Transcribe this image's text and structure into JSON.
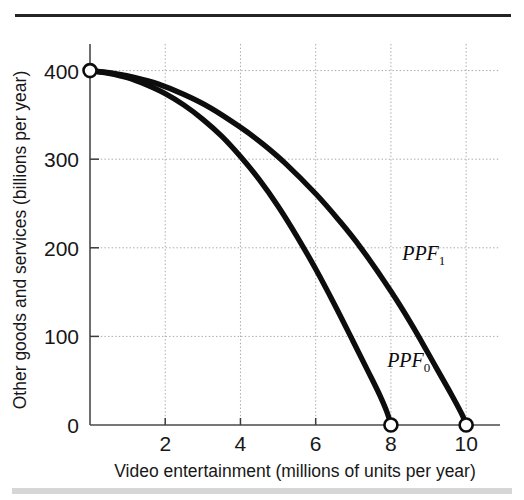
{
  "chart_data": {
    "type": "line",
    "title": "",
    "xlabel": "Video entertainment (millions of units per year)",
    "ylabel": "Other goods and services (billions per year)",
    "xlim": [
      0,
      10.9
    ],
    "ylim": [
      0,
      430
    ],
    "xticks": [
      2,
      4,
      6,
      8,
      10
    ],
    "xtick_labels": [
      "2",
      "4",
      "6",
      "8",
      "10"
    ],
    "yticks": [
      0,
      100,
      200,
      300,
      400
    ],
    "ytick_labels": [
      "0",
      "100",
      "200",
      "300",
      "400"
    ],
    "grid": true,
    "grid_style": "dotted",
    "legend_position": "inline-annotation",
    "series": [
      {
        "name": "PPF_0",
        "label": "PPF",
        "subscript": "0",
        "label_x": 7.9,
        "label_y": 65,
        "color": "#0d0d0d",
        "x": [
          0.0,
          0.5,
          1.0,
          1.5,
          2.0,
          2.5,
          3.0,
          3.5,
          4.0,
          4.5,
          5.0,
          5.5,
          6.0,
          6.5,
          7.0,
          7.4,
          7.7,
          7.9,
          8.0
        ],
        "y": [
          400,
          397,
          392,
          384,
          374,
          361,
          345,
          326,
          303,
          277,
          247,
          213,
          176,
          136,
          94,
          60,
          34,
          14,
          0
        ]
      },
      {
        "name": "PPF_1",
        "label": "PPF",
        "subscript": "1",
        "label_x": 8.3,
        "label_y": 186,
        "color": "#0d0d0d",
        "x": [
          0.0,
          0.6,
          1.2,
          1.8,
          2.5,
          3.2,
          4.0,
          4.6,
          5.2,
          6.0,
          6.6,
          7.2,
          8.0,
          8.6,
          9.2,
          9.6,
          9.9,
          10.0
        ],
        "y": [
          400,
          397,
          392,
          385,
          373,
          358,
          336,
          317,
          295,
          261,
          232,
          200,
          151,
          110,
          65,
          35,
          11,
          0
        ]
      }
    ],
    "markers": [
      {
        "name": "shared-origin-marker",
        "x": 0,
        "y": 400
      },
      {
        "name": "ppf0-endpoint-marker",
        "x": 8,
        "y": 0
      },
      {
        "name": "ppf1-endpoint-marker",
        "x": 10,
        "y": 0
      }
    ]
  },
  "figure": {
    "top_rule_color": "#242424",
    "bottom_band_color": "#cfcfcf",
    "background": "#ffffff",
    "axis_color": "#4a4a4a",
    "grid_color": "#a8a8a8",
    "curve_color": "#0d0d0d"
  }
}
